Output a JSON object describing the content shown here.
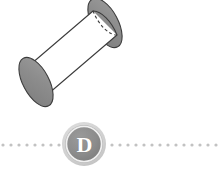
{
  "figure": {
    "kind": "geometry-solid-figure",
    "background_color": "#ffffff",
    "width": 221,
    "height": 173,
    "solid": {
      "name": "cylinder",
      "orientation_description": "oblique, tilted up-to-the-right about 45 degrees",
      "body_fill_color": "#ffffff",
      "end_face_fill_color": "#8a8a8a",
      "outline_color": "#3c3c3c",
      "outline_width": 1.1,
      "hidden_edge_style": "dashed",
      "near_end_center": [
        36,
        82
      ],
      "far_end_center": [
        105,
        23
      ],
      "end_radius_major": 27,
      "end_radius_minor": 13,
      "end_rotation_deg": 62
    }
  },
  "choice_marker": {
    "letter": "D",
    "shape": "circle",
    "outer_ring_color": "#cfcfcf",
    "inner_disc_color": "#8c8c8c",
    "letter_color": "#ffffff",
    "letter_ring_color": "#f2f2f2",
    "center": [
      84,
      144
    ],
    "outer_radius": 22
  },
  "divider": {
    "style": "dotted",
    "dot_color": "#c2c2c2",
    "dot_diameter": 3,
    "dot_spacing": 8,
    "y": 145,
    "left_segment": {
      "x_start": 2,
      "x_end": 60
    },
    "right_segment": {
      "x_start": 110,
      "x_end": 219
    }
  }
}
